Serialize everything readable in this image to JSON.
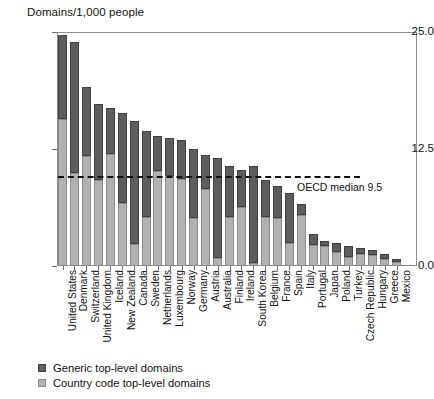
{
  "chart_data": {
    "type": "bar",
    "stacked": true,
    "title": "",
    "ylabel": "Domains/1,000 people",
    "xlabel": "",
    "ylim": [
      0.0,
      25.0
    ],
    "ytick_labels": [
      "0.0",
      "12.5",
      "25.0"
    ],
    "ytick_values": [
      0.0,
      12.5,
      25.0
    ],
    "grid": false,
    "legend_position": "below-axis-left",
    "categories": [
      "United States",
      "Denmark",
      "Switzerland",
      "United Kingdom",
      "Iceland",
      "New Zealand",
      "Canada",
      "Sweden",
      "Netherlands",
      "Luxembourg",
      "Norway",
      "Germany",
      "Austria",
      "Australia",
      "Finland",
      "Ireland",
      "South Korea",
      "Belgium",
      "France",
      "Spain",
      "Italy",
      "Portugal",
      "Japan",
      "Poland",
      "Turkey",
      "Czech Republic",
      "Hungary",
      "Greece",
      "Mexico"
    ],
    "series": [
      {
        "name": "Generic top-level domains",
        "color": "#5d5d5d",
        "values": [
          9.0,
          14.0,
          7.4,
          8.2,
          5.0,
          9.6,
          13.2,
          9.2,
          3.7,
          4.0,
          4.2,
          7.4,
          3.6,
          10.7,
          5.4,
          4.0,
          10.4,
          3.9,
          3.5,
          5.3,
          1.2,
          1.1,
          0.6,
          1.0,
          1.1,
          0.6,
          0.5,
          0.5,
          0.4
        ]
      },
      {
        "name": "Country code top-level domains",
        "color": "#b1b1b1",
        "values": [
          15.8,
          10.0,
          11.8,
          9.2,
          12.0,
          6.8,
          2.4,
          5.3,
          10.2,
          9.7,
          9.3,
          5.2,
          8.3,
          0.9,
          5.3,
          6.3,
          0.3,
          5.3,
          5.1,
          2.5,
          5.5,
          2.3,
          2.1,
          1.5,
          1.0,
          1.3,
          1.2,
          0.8,
          0.4
        ]
      }
    ],
    "totals": [
      24.8,
      24.0,
      19.2,
      17.4,
      17.0,
      16.4,
      15.6,
      14.5,
      13.9,
      13.7,
      13.5,
      12.6,
      11.9,
      11.6,
      10.7,
      10.3,
      10.7,
      9.2,
      8.6,
      7.8,
      6.7,
      3.4,
      2.7,
      2.5,
      2.1,
      1.9,
      1.7,
      1.3,
      0.8
    ],
    "annotations": [
      {
        "name": "oecd-median-line",
        "label": "OECD median 9.5",
        "value": 9.5,
        "style": "dashed-horizontal"
      }
    ]
  },
  "legend": {
    "items": [
      {
        "label": "Generic top-level domains",
        "swatch": "dark-gray-swatch"
      },
      {
        "label": "Country code top-level domains",
        "swatch": "light-gray-swatch"
      }
    ]
  }
}
